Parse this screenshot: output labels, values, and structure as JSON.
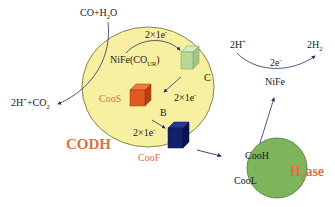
{
  "colors": {
    "codh_fill": "#f7f0a0",
    "codh_stroke": "#6a6a30",
    "h2ase_fill": "#7db55c",
    "h2ase_stroke": "#4e7a38",
    "cube_c": "#b8d89a",
    "cube_coos": "#e05a20",
    "cube_coof": "#13206a",
    "label_orange": "#e07040",
    "arrow": "#2a2f6a"
  },
  "substrate": {
    "co_h2o_main": "CO+H",
    "co_h2o_sub": "2",
    "co_h2o_end": "O"
  },
  "product_co2": {
    "pre": "2H",
    "sup": "+",
    "mid": "+CO",
    "sub": "2"
  },
  "codh": {
    "label": "CODH",
    "active_site": {
      "main": "NiFe(CO",
      "sub": "UR",
      "end": ")"
    },
    "cluster_c": "C",
    "cluster_b": "B",
    "coos": "CooS",
    "coof": "CooF",
    "transfers": [
      {
        "main": "2×1e",
        "sup": "-"
      },
      {
        "main": "2×1e",
        "sup": "-"
      },
      {
        "main": "2×1e",
        "sup": "-"
      }
    ]
  },
  "h2ase": {
    "label_pre": "H",
    "label_sub": "2",
    "label_end": "ase",
    "cooh": "CooH",
    "cool": "CooL",
    "active_site": "NiFe"
  },
  "h2_reaction": {
    "reactant_pre": "2H",
    "reactant_sup": "+",
    "product_pre": "2H",
    "product_sub": "2",
    "electrons_main": "2e",
    "electrons_sup": "-"
  }
}
